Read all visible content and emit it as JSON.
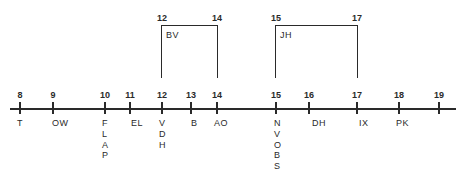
{
  "diagram": {
    "type": "timeline",
    "axis": {
      "ticks": [
        {
          "value": "8",
          "x": 20,
          "label": "T",
          "label_dx": -2,
          "vertical": false
        },
        {
          "value": "9",
          "x": 53,
          "label": "OW",
          "label_dx": 0,
          "vertical": false
        },
        {
          "value": "10",
          "x": 105,
          "label": "FLAP",
          "label_dx": -2,
          "vertical": true
        },
        {
          "value": "11",
          "x": 130,
          "label": "EL",
          "label_dx": 2,
          "vertical": false
        },
        {
          "value": "12",
          "x": 162,
          "label": "VDH",
          "label_dx": -2,
          "vertical": true
        },
        {
          "value": "13",
          "x": 191,
          "label": "B",
          "label_dx": 1,
          "vertical": false
        },
        {
          "value": "14",
          "x": 217,
          "label": "AO",
          "label_dx": -2,
          "vertical": false
        },
        {
          "value": "15",
          "x": 276,
          "label": "NVOBS",
          "label_dx": -1,
          "vertical": true
        },
        {
          "value": "16",
          "x": 309,
          "label": "DH",
          "label_dx": 4,
          "vertical": false
        },
        {
          "value": "17",
          "x": 357,
          "label": "IX",
          "label_dx": 3,
          "vertical": false
        },
        {
          "value": "18",
          "x": 399,
          "label": "PK",
          "label_dx": -2,
          "vertical": false
        },
        {
          "value": "19",
          "x": 439,
          "label": "",
          "label_dx": 0,
          "vertical": false
        }
      ]
    },
    "brackets": [
      {
        "name": "BV",
        "start": "12",
        "end": "14",
        "x1": 162,
        "x2": 217
      },
      {
        "name": "JH",
        "start": "15",
        "end": "17",
        "x1": 276,
        "x2": 357
      }
    ]
  }
}
